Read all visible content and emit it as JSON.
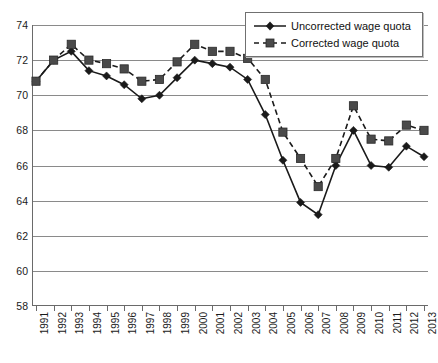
{
  "chart_data": {
    "type": "line",
    "title": "",
    "subtitle": "",
    "xlabel": "",
    "ylabel": "",
    "grid": true,
    "legend_position": "top-right",
    "ylim": [
      58,
      74
    ],
    "yticks": [
      58,
      60,
      62,
      64,
      66,
      68,
      70,
      72,
      74
    ],
    "categories": [
      "1991",
      "1992",
      "1993",
      "1994",
      "1995",
      "1996",
      "1997",
      "1998",
      "1999",
      "2000",
      "2001",
      "2002",
      "2003",
      "2004",
      "2005",
      "2006",
      "2007",
      "2008",
      "2009",
      "2010",
      "2011",
      "2012",
      "2013"
    ],
    "series": [
      {
        "name": "Uncorrected wage quota",
        "marker": "diamond",
        "linestyle": "solid",
        "color": "#1a1a1a",
        "values": [
          70.8,
          72.0,
          72.5,
          71.4,
          71.1,
          70.6,
          69.8,
          70.0,
          71.0,
          72.0,
          71.8,
          71.6,
          70.9,
          68.9,
          66.3,
          63.9,
          63.2,
          66.0,
          68.0,
          66.0,
          65.9,
          67.1,
          66.5
        ]
      },
      {
        "name": "Corrected wage quota",
        "marker": "square",
        "linestyle": "dashed",
        "color": "#4a4a4a",
        "values": [
          70.8,
          72.0,
          72.9,
          72.0,
          71.8,
          71.5,
          70.8,
          70.9,
          71.9,
          72.9,
          72.5,
          72.5,
          72.1,
          70.9,
          67.9,
          66.4,
          64.8,
          66.4,
          69.4,
          67.5,
          67.4,
          68.3,
          68.0
        ]
      }
    ]
  },
  "legend": {
    "items": [
      {
        "label": "Uncorrected wage quota",
        "marker": "diamond-icon",
        "style": "solid"
      },
      {
        "label": "Corrected wage quota",
        "marker": "square-icon",
        "style": "dashed"
      }
    ]
  }
}
